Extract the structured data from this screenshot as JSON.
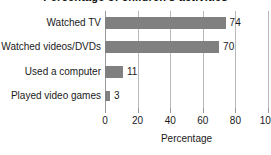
{
  "title_fragment": "Percentage of children's activities",
  "chart_data": {
    "type": "bar",
    "orientation": "horizontal",
    "title": "",
    "xlabel": "Percentage",
    "ylabel": "",
    "xlim": [
      0,
      100
    ],
    "xticks": [
      0,
      20,
      40,
      60,
      80,
      100
    ],
    "xtick_labels": [
      "0",
      "20",
      "40",
      "60",
      "80",
      "100"
    ],
    "grid": true,
    "legend": false,
    "bar_color": "#808080",
    "categories": [
      "Watched TV",
      "Watched videos/DVDs",
      "Used a computer",
      "Played video games"
    ],
    "values": [
      74,
      70,
      11,
      3
    ],
    "value_labels": [
      "74",
      "70",
      "11",
      "3"
    ]
  }
}
